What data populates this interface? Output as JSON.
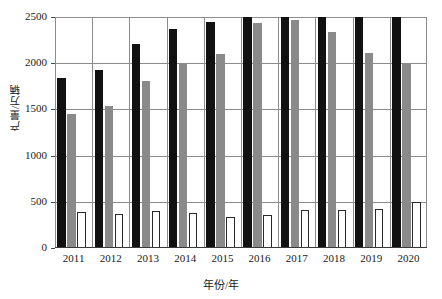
{
  "chart_data": {
    "type": "bar",
    "title": "",
    "xlabel": "年份/年",
    "ylabel": "产量/万辆",
    "categories": [
      "2011",
      "2012",
      "2013",
      "2014",
      "2015",
      "2016",
      "2017",
      "2018",
      "2019",
      "2020"
    ],
    "ylim": [
      0,
      2500
    ],
    "yticks": [
      0,
      500,
      1000,
      1500,
      2000,
      2500
    ],
    "ytick_labels": [
      "0",
      "500",
      "1000",
      "1500",
      "2000",
      "2500"
    ],
    "grid": true,
    "legend": "none",
    "series": [
      {
        "name": "black-series",
        "color": "#111111",
        "values": [
          1840,
          1930,
          2210,
          2370,
          2450,
          2500,
          2500,
          2500,
          2500,
          2500
        ]
      },
      {
        "name": "gray-series",
        "color": "#8a8a8a",
        "values": [
          1450,
          1540,
          1810,
          1990,
          2100,
          2440,
          2470,
          2340,
          2110,
          1990
        ]
      },
      {
        "name": "white-series",
        "color": "#ffffff",
        "values": [
          395,
          370,
          400,
          375,
          340,
          360,
          410,
          415,
          420,
          500
        ]
      }
    ]
  }
}
